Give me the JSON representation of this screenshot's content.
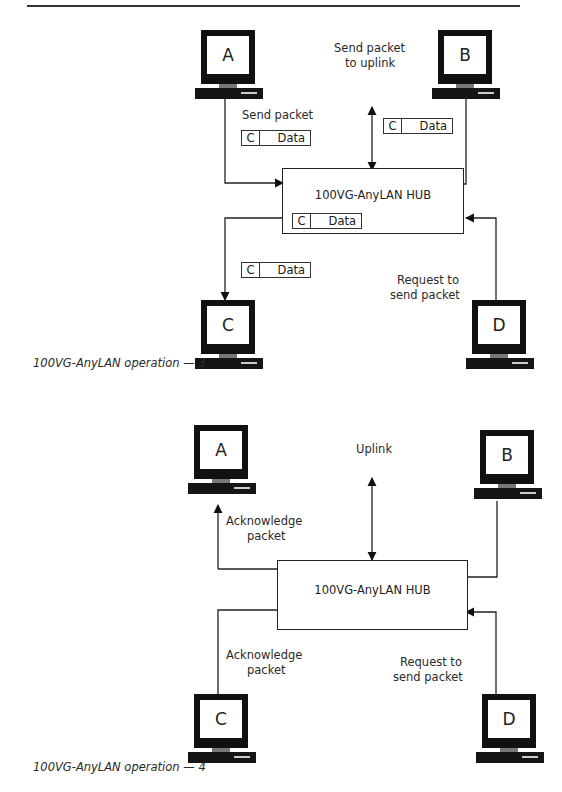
{
  "figure3": {
    "caption": "100VG-AnyLAN operation — 3",
    "hub_label": "100VG-AnyLAN HUB",
    "computers": {
      "a": "A",
      "b": "B",
      "c": "C",
      "d": "D"
    },
    "labels": {
      "send_packet": "Send packet",
      "send_uplink_1": "Send packet",
      "send_uplink_2": "to uplink",
      "request_1": "Request to",
      "request_2": "send packet"
    },
    "packets": [
      {
        "dest": "C",
        "payload": "Data"
      },
      {
        "dest": "C",
        "payload": "Data"
      },
      {
        "dest": "C",
        "payload": "Data"
      },
      {
        "dest": "C",
        "payload": "Data"
      }
    ]
  },
  "figure4": {
    "caption": "100VG-AnyLAN operation — 4",
    "hub_label": "100VG-AnyLAN HUB",
    "computers": {
      "a": "A",
      "b": "B",
      "c": "C",
      "d": "D"
    },
    "labels": {
      "uplink": "Uplink",
      "ack_a_1": "Acknowledge",
      "ack_a_2": "packet",
      "ack_c_1": "Acknowledge",
      "ack_c_2": "packet",
      "request_1": "Request to",
      "request_2": "send packet"
    }
  }
}
